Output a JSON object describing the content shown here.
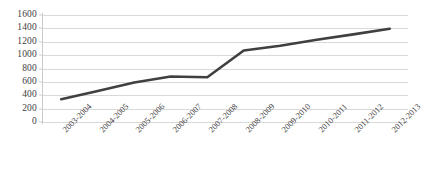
{
  "chart_data": {
    "type": "line",
    "title": "",
    "subtitle": "",
    "xlabel": "",
    "ylabel": "",
    "categories": [
      "2003-2004",
      "2004-2005",
      "2005-2006",
      "2006-2007",
      "2007-2008",
      "2008-2009",
      "2009-2010",
      "2010-2011",
      "2011-2012",
      "2012-2013"
    ],
    "values": [
      340,
      465,
      590,
      680,
      670,
      1070,
      1140,
      1230,
      1310,
      1395
    ],
    "series": [
      {
        "name": "",
        "values": [
          340,
          465,
          590,
          680,
          670,
          1070,
          1140,
          1230,
          1310,
          1395
        ]
      }
    ],
    "ylim": [
      0,
      1600
    ],
    "ytick_values": [
      0,
      200,
      400,
      600,
      800,
      1000,
      1200,
      1400,
      1600
    ],
    "ytick_labels": [
      "0",
      "200",
      "400",
      "600",
      "800",
      "1000",
      "1200",
      "1400",
      "1600"
    ],
    "grid": true,
    "grid_axis": "y",
    "legend": false,
    "legend_position": "none",
    "markers": false,
    "line_color": "#404040",
    "grid_color": "#d9d9d9",
    "background_color": "#ffffff",
    "line_width": 2.6
  }
}
